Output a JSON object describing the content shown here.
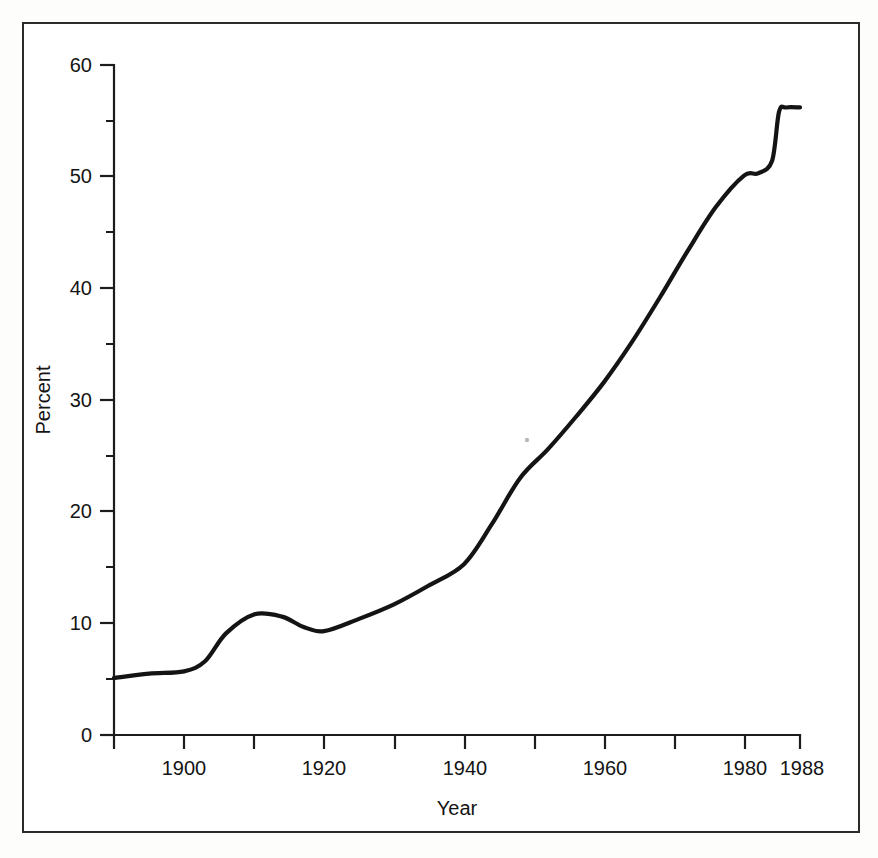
{
  "figure": {
    "background_color": "#ffffff",
    "border_color": "#2b2b2b",
    "line_color": "#141414"
  },
  "chart_data": {
    "type": "line",
    "title": "",
    "xlabel": "Year",
    "ylabel": "Percent",
    "xlim": [
      1890,
      1988
    ],
    "ylim": [
      0,
      60
    ],
    "grid": false,
    "legend": null,
    "x_ticks_major": [
      1900,
      1920,
      1940,
      1960,
      1980,
      1988
    ],
    "x_tick_labels": [
      "1900",
      "1920",
      "1940",
      "1960",
      "1980",
      "1988"
    ],
    "x_ticks_all": [
      1890,
      1900,
      1910,
      1920,
      1930,
      1940,
      1950,
      1960,
      1970,
      1980,
      1988
    ],
    "y_ticks_major": [
      0,
      10,
      20,
      30,
      40,
      50,
      60
    ],
    "y_tick_labels": [
      "0",
      "10",
      "20",
      "30",
      "40",
      "50",
      "60"
    ],
    "y_ticks_minor": [
      5,
      15,
      25,
      35,
      45,
      55
    ],
    "series": [
      {
        "name": "Percent",
        "x": [
          1890,
          1895,
          1900,
          1903,
          1906,
          1910,
          1914,
          1917,
          1920,
          1925,
          1930,
          1935,
          1940,
          1944,
          1948,
          1952,
          1956,
          1960,
          1964,
          1968,
          1972,
          1976,
          1980,
          1982,
          1984,
          1985,
          1986,
          1988
        ],
        "values": [
          5.1,
          5.5,
          5.7,
          6.6,
          9.1,
          10.8,
          10.6,
          9.7,
          9.3,
          10.4,
          11.7,
          13.4,
          15.3,
          18.9,
          23.0,
          25.6,
          28.5,
          31.6,
          35.2,
          39.2,
          43.4,
          47.3,
          50.1,
          50.3,
          51.4,
          55.8,
          56.2,
          56.2
        ]
      }
    ]
  },
  "axis_titles": {
    "x": "Year",
    "y": "Percent"
  }
}
